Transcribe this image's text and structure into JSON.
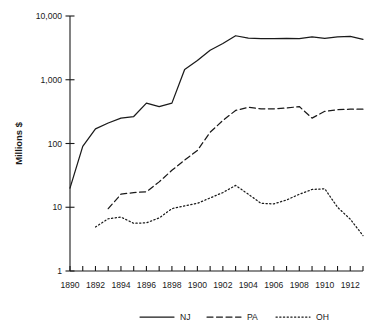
{
  "chart_data": {
    "type": "line",
    "title": "",
    "xlabel": "",
    "ylabel": "Millions $",
    "yscale": "log",
    "ylim": [
      1,
      10000
    ],
    "xlim": [
      1890,
      1913
    ],
    "grid": false,
    "legend_position": "bottom",
    "y_tick_labels": [
      "10,000",
      "1,000",
      "100",
      "10",
      "1"
    ],
    "y_tick_values": [
      10000,
      1000,
      100,
      10,
      1
    ],
    "x_tick_labels": [
      "1890",
      "1892",
      "1894",
      "1896",
      "1898",
      "1900",
      "1902",
      "1904",
      "1906",
      "1908",
      "1910",
      "1912"
    ],
    "x_tick_values": [
      1890,
      1892,
      1894,
      1896,
      1898,
      1900,
      1902,
      1904,
      1906,
      1908,
      1910,
      1912
    ],
    "x_minor_ticks": [
      1891,
      1893,
      1895,
      1897,
      1899,
      1901,
      1903,
      1905,
      1907,
      1909,
      1911,
      1913
    ],
    "x": [
      1890,
      1891,
      1892,
      1893,
      1894,
      1895,
      1896,
      1897,
      1898,
      1899,
      1900,
      1901,
      1902,
      1903,
      1904,
      1905,
      1906,
      1907,
      1908,
      1909,
      1910,
      1911,
      1912,
      1913
    ],
    "series": [
      {
        "name": "NJ",
        "style": "solid",
        "color": "#1a1a1a",
        "x": [
          1890,
          1891,
          1892,
          1893,
          1894,
          1895,
          1896,
          1897,
          1898,
          1899,
          1900,
          1901,
          1902,
          1903,
          1904,
          1905,
          1906,
          1907,
          1908,
          1909,
          1910,
          1911,
          1912,
          1913
        ],
        "values": [
          20,
          90,
          170,
          210,
          250,
          265,
          430,
          380,
          430,
          1450,
          2000,
          2900,
          3700,
          4900,
          4500,
          4400,
          4400,
          4450,
          4400,
          4700,
          4450,
          4700,
          4800,
          4300
        ]
      },
      {
        "name": "PA",
        "style": "dashed",
        "color": "#1a1a1a",
        "x": [
          1893,
          1894,
          1895,
          1896,
          1897,
          1898,
          1899,
          1900,
          1901,
          1902,
          1903,
          1904,
          1905,
          1906,
          1907,
          1908,
          1909,
          1910,
          1911,
          1912,
          1913
        ],
        "values": [
          9.5,
          16,
          17,
          17.5,
          25,
          38,
          55,
          78,
          150,
          230,
          330,
          370,
          350,
          350,
          360,
          380,
          250,
          320,
          340,
          345,
          345
        ]
      },
      {
        "name": "OH",
        "style": "dotted",
        "color": "#1a1a1a",
        "x": [
          1892,
          1893,
          1894,
          1895,
          1896,
          1897,
          1898,
          1899,
          1900,
          1901,
          1902,
          1903,
          1904,
          1905,
          1906,
          1907,
          1908,
          1909,
          1910,
          1911,
          1912,
          1913
        ],
        "values": [
          4.9,
          6.6,
          7.0,
          5.6,
          5.7,
          6.8,
          9.5,
          10.5,
          11.5,
          14,
          17,
          22,
          16,
          11.5,
          11.3,
          13,
          16,
          19,
          19.5,
          10,
          6.5,
          3.6
        ]
      }
    ]
  },
  "legend": {
    "items": [
      {
        "label": "NJ",
        "style": "solid"
      },
      {
        "label": "PA",
        "style": "dashed"
      },
      {
        "label": "OH",
        "style": "dotted"
      }
    ]
  }
}
